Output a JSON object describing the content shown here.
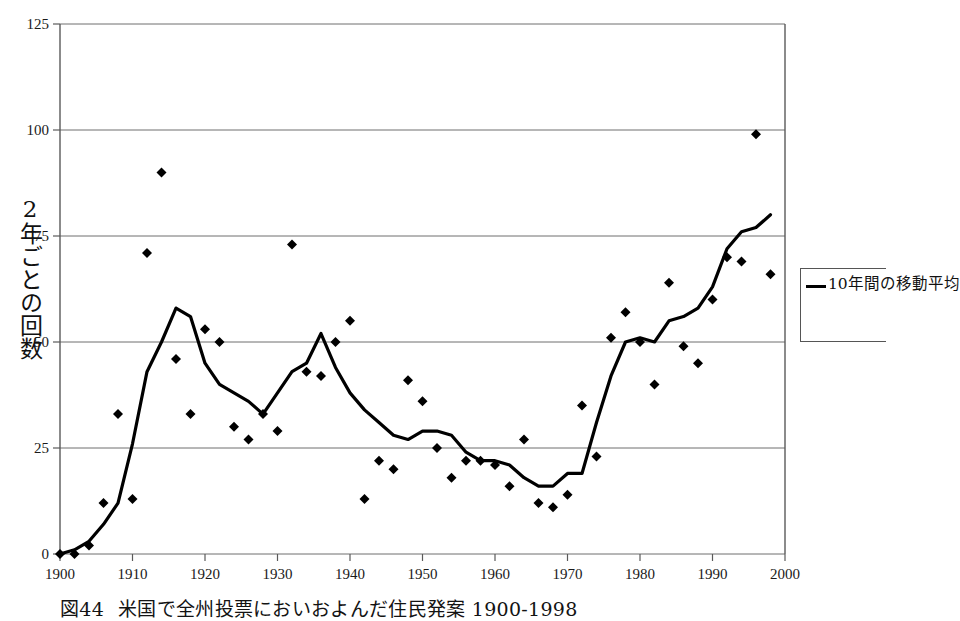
{
  "figure": {
    "caption_number": "図44",
    "caption_text": "米国で全州投票においおよんだ住民発案 1900-1998"
  },
  "legend": {
    "position": "right",
    "entries": [
      {
        "label": "10年間の移動平均",
        "type": "line",
        "color": "#000000"
      }
    ]
  },
  "chart_data": {
    "type": "scatter",
    "title": "",
    "xlabel": "",
    "ylabel": "2年ごとの回数",
    "xlim": [
      1900,
      2000
    ],
    "ylim": [
      0,
      125
    ],
    "xticks": [
      1900,
      1910,
      1920,
      1930,
      1940,
      1950,
      1960,
      1970,
      1980,
      1990,
      2000
    ],
    "yticks": [
      0,
      25,
      50,
      75,
      100,
      125
    ],
    "xtick_labels": [
      "1900",
      "1910",
      "1920",
      "1930",
      "1940",
      "1950",
      "1960",
      "1970",
      "1980",
      "1990",
      "2000"
    ],
    "ytick_labels": [
      "0",
      "25",
      "50",
      "75",
      "100",
      "125"
    ],
    "grid": "horizontal",
    "legend_position": "right",
    "series": [
      {
        "name": "2年ごとの回数",
        "type": "scatter",
        "marker": "diamond",
        "color": "#000000",
        "points": [
          [
            1900,
            0
          ],
          [
            1902,
            0
          ],
          [
            1904,
            2
          ],
          [
            1906,
            12
          ],
          [
            1908,
            33
          ],
          [
            1910,
            13
          ],
          [
            1912,
            71
          ],
          [
            1914,
            90
          ],
          [
            1916,
            46
          ],
          [
            1918,
            33
          ],
          [
            1920,
            53
          ],
          [
            1922,
            50
          ],
          [
            1924,
            30
          ],
          [
            1926,
            27
          ],
          [
            1928,
            33
          ],
          [
            1930,
            29
          ],
          [
            1932,
            73
          ],
          [
            1934,
            43
          ],
          [
            1936,
            42
          ],
          [
            1938,
            50
          ],
          [
            1940,
            55
          ],
          [
            1942,
            13
          ],
          [
            1944,
            22
          ],
          [
            1946,
            20
          ],
          [
            1948,
            41
          ],
          [
            1950,
            36
          ],
          [
            1952,
            25
          ],
          [
            1954,
            18
          ],
          [
            1956,
            22
          ],
          [
            1958,
            22
          ],
          [
            1960,
            21
          ],
          [
            1962,
            16
          ],
          [
            1964,
            27
          ],
          [
            1966,
            12
          ],
          [
            1968,
            11
          ],
          [
            1970,
            14
          ],
          [
            1972,
            35
          ],
          [
            1974,
            23
          ],
          [
            1976,
            51
          ],
          [
            1978,
            57
          ],
          [
            1980,
            50
          ],
          [
            1982,
            40
          ],
          [
            1984,
            64
          ],
          [
            1986,
            49
          ],
          [
            1988,
            45
          ],
          [
            1990,
            60
          ],
          [
            1992,
            70
          ],
          [
            1994,
            69
          ],
          [
            1996,
            99
          ],
          [
            1998,
            66
          ]
        ]
      },
      {
        "name": "10年間の移動平均",
        "type": "line",
        "color": "#000000",
        "points": [
          [
            1900,
            0
          ],
          [
            1902,
            1
          ],
          [
            1904,
            3
          ],
          [
            1906,
            7
          ],
          [
            1908,
            12
          ],
          [
            1910,
            26
          ],
          [
            1912,
            43
          ],
          [
            1914,
            50
          ],
          [
            1916,
            58
          ],
          [
            1918,
            56
          ],
          [
            1920,
            45
          ],
          [
            1922,
            40
          ],
          [
            1924,
            38
          ],
          [
            1926,
            36
          ],
          [
            1928,
            33
          ],
          [
            1930,
            38
          ],
          [
            1932,
            43
          ],
          [
            1934,
            45
          ],
          [
            1936,
            52
          ],
          [
            1938,
            44
          ],
          [
            1940,
            38
          ],
          [
            1942,
            34
          ],
          [
            1944,
            31
          ],
          [
            1946,
            28
          ],
          [
            1948,
            27
          ],
          [
            1950,
            29
          ],
          [
            1952,
            29
          ],
          [
            1954,
            28
          ],
          [
            1956,
            24
          ],
          [
            1958,
            22
          ],
          [
            1960,
            22
          ],
          [
            1962,
            21
          ],
          [
            1964,
            18
          ],
          [
            1966,
            16
          ],
          [
            1968,
            16
          ],
          [
            1970,
            19
          ],
          [
            1972,
            19
          ],
          [
            1974,
            31
          ],
          [
            1976,
            42
          ],
          [
            1978,
            50
          ],
          [
            1980,
            51
          ],
          [
            1982,
            50
          ],
          [
            1984,
            55
          ],
          [
            1986,
            56
          ],
          [
            1988,
            58
          ],
          [
            1990,
            63
          ],
          [
            1992,
            72
          ],
          [
            1994,
            76
          ],
          [
            1996,
            77
          ],
          [
            1998,
            80
          ]
        ]
      }
    ]
  }
}
